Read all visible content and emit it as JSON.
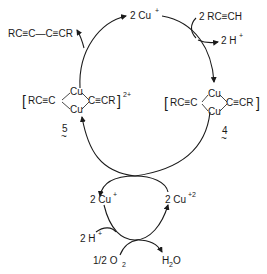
{
  "diagram": {
    "outer_cycle": {
      "product": "RC≡C—C≡CR",
      "catalyst_top": {
        "coef": "2",
        "species": "Cu",
        "charge": "+"
      },
      "substrate": "2 RC≡CH",
      "byproduct": {
        "coef": "2",
        "species": "H",
        "charge": "+"
      },
      "complex_left": {
        "left_ligand": "RC≡C",
        "right_ligand": "C≡CR",
        "metal_top": "Cu",
        "metal_bottom": "Cu",
        "charge": "2+",
        "label": "5"
      },
      "complex_right": {
        "left_ligand": "RC≡C",
        "right_ligand": "C≡CR",
        "metal_top": "Cu",
        "metal_bottom": "Cu",
        "label": "4"
      }
    },
    "inner_cycle": {
      "left_species": {
        "coef": "2",
        "species": "Cu",
        "charge": "+"
      },
      "right_species": {
        "coef": "2",
        "species": "Cu",
        "charge": "+2"
      },
      "proton": {
        "coef": "2",
        "species": "H",
        "charge": "+"
      },
      "oxidant": {
        "text": "1/2 O",
        "subscript": "2"
      },
      "water": {
        "h": "H",
        "subscript": "2",
        "o": "O"
      }
    },
    "colors": {
      "ink": "#1a1a1a",
      "background": "#ffffff"
    }
  }
}
